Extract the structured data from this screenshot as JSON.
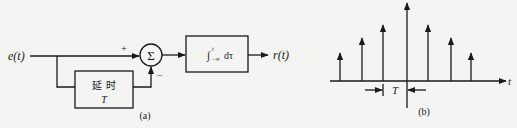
{
  "figure_a": {
    "caption": "(a)",
    "input_label": "e(t)",
    "output_label": "r(t)",
    "summer_symbol": "Σ",
    "plus_sign": "+",
    "minus_sign": "−",
    "delay_block": {
      "line1": "延 时",
      "line2": "T"
    },
    "integrator_block": {
      "label": "∫",
      "upper": "t",
      "lower": "−∞",
      "suffix": "dτ"
    }
  },
  "figure_b": {
    "caption": "(b)",
    "axis_label": "t",
    "period_label": "T",
    "impulses": [
      {
        "x": 340,
        "top": 53
      },
      {
        "x": 362,
        "top": 38
      },
      {
        "x": 383,
        "top": 25
      },
      {
        "x": 428,
        "top": 25
      },
      {
        "x": 451,
        "top": 38
      },
      {
        "x": 471,
        "top": 53
      }
    ]
  },
  "colors": {
    "stroke": "#1a1a1a",
    "background": "#f4f4f2"
  }
}
